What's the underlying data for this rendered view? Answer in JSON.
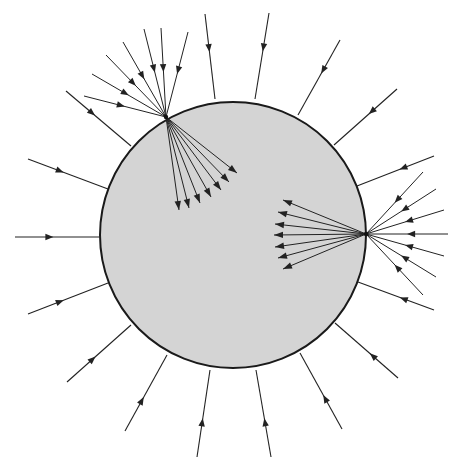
{
  "diagram": {
    "sphere": {
      "cx": 233,
      "cy": 235,
      "r": 133,
      "fill": "#d4d4d4",
      "stroke": "#1a1a1a"
    },
    "line_color": "#222222",
    "incoming_rays": [
      {
        "x1": 205,
        "y1": 14,
        "x2": 215,
        "y2": 99
      },
      {
        "x1": 269,
        "y1": 13,
        "x2": 255,
        "y2": 99
      },
      {
        "x1": 340,
        "y1": 40,
        "x2": 298,
        "y2": 115
      },
      {
        "x1": 397,
        "y1": 89,
        "x2": 334,
        "y2": 145
      },
      {
        "x1": 434,
        "y1": 156,
        "x2": 357,
        "y2": 186
      },
      {
        "x1": 434,
        "y1": 310,
        "x2": 358,
        "y2": 282
      },
      {
        "x1": 398,
        "y1": 378,
        "x2": 335,
        "y2": 323
      },
      {
        "x1": 342,
        "y1": 429,
        "x2": 300,
        "y2": 353
      },
      {
        "x1": 271,
        "y1": 457,
        "x2": 256,
        "y2": 370
      },
      {
        "x1": 197,
        "y1": 457,
        "x2": 210,
        "y2": 370
      },
      {
        "x1": 125,
        "y1": 431,
        "x2": 167,
        "y2": 355
      },
      {
        "x1": 67,
        "y1": 382,
        "x2": 131,
        "y2": 325
      },
      {
        "x1": 28,
        "y1": 314,
        "x2": 108,
        "y2": 283
      },
      {
        "x1": 15,
        "y1": 237,
        "x2": 101,
        "y2": 237
      },
      {
        "x1": 28,
        "y1": 159,
        "x2": 108,
        "y2": 189
      },
      {
        "x1": 66,
        "y1": 91,
        "x2": 131,
        "y2": 146
      }
    ],
    "emitter_points": [
      {
        "x": 166,
        "y": 117,
        "incoming": [
          {
            "x": 84,
            "y": 96
          },
          {
            "x": 92,
            "y": 74
          },
          {
            "x": 106,
            "y": 55
          },
          {
            "x": 123,
            "y": 42
          },
          {
            "x": 144,
            "y": 29
          },
          {
            "x": 161,
            "y": 28
          },
          {
            "x": 188,
            "y": 32
          }
        ],
        "outgoing": [
          {
            "x": 179,
            "y": 210
          },
          {
            "x": 189,
            "y": 208
          },
          {
            "x": 200,
            "y": 203
          },
          {
            "x": 211,
            "y": 197
          },
          {
            "x": 221,
            "y": 190
          },
          {
            "x": 229,
            "y": 182
          },
          {
            "x": 237,
            "y": 173
          }
        ]
      },
      {
        "x": 366,
        "y": 234,
        "incoming": [
          {
            "x": 423,
            "y": 172
          },
          {
            "x": 436,
            "y": 189
          },
          {
            "x": 444,
            "y": 210
          },
          {
            "x": 448,
            "y": 234
          },
          {
            "x": 444,
            "y": 256
          },
          {
            "x": 436,
            "y": 277
          },
          {
            "x": 423,
            "y": 295
          }
        ],
        "outgoing": [
          {
            "x": 283,
            "y": 200
          },
          {
            "x": 278,
            "y": 212
          },
          {
            "x": 275,
            "y": 224
          },
          {
            "x": 274,
            "y": 235
          },
          {
            "x": 275,
            "y": 247
          },
          {
            "x": 278,
            "y": 258
          },
          {
            "x": 283,
            "y": 269
          }
        ]
      }
    ]
  }
}
